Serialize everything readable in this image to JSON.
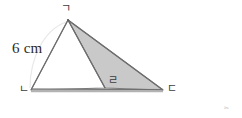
{
  "figure": {
    "type": "geometry-diagram",
    "background_color": "#ffffff",
    "shaded_fill_color": "#c9c9c9",
    "outline_color": "#6e6e6e",
    "base_band_color": "#b0b0b0",
    "measurement": {
      "label": "6 cm",
      "value": 6,
      "unit": "cm",
      "applies_to_side": "ㄱㄴ"
    },
    "vertices": [
      {
        "id": "g",
        "label": "ㄱ",
        "x": 68,
        "y": 20,
        "label_x": 61,
        "label_y": 3
      },
      {
        "id": "n",
        "label": "ㄴ",
        "x": 31,
        "y": 90,
        "label_x": 19,
        "label_y": 85
      },
      {
        "id": "r",
        "label": "ㄹ",
        "x": 105,
        "y": 88,
        "label_x": 108,
        "label_y": 76
      },
      {
        "id": "d",
        "label": "ㄷ",
        "x": 163,
        "y": 90,
        "label_x": 167,
        "label_y": 84
      }
    ],
    "triangles": [
      {
        "id": "left-triangle",
        "vertex_ids": [
          "g",
          "n",
          "r"
        ],
        "filled": false,
        "fill": "#ffffff"
      },
      {
        "id": "right-triangle",
        "vertex_ids": [
          "g",
          "r",
          "d"
        ],
        "filled": true,
        "fill": "#c9c9c9"
      }
    ],
    "corner_mark": "✂"
  }
}
